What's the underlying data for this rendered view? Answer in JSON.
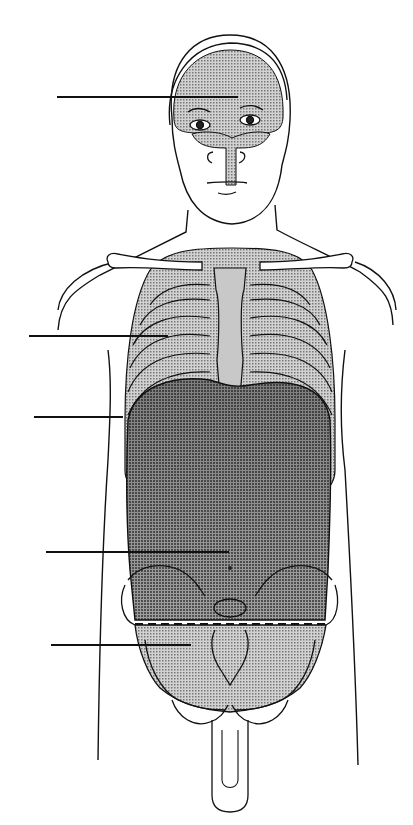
{
  "figure": {
    "width": 413,
    "height": 825,
    "background": "#ffffff",
    "stroke": "#111111",
    "cavity_fill_light": "#b8b8b8",
    "cavity_fill_dark": "#8a8a8a",
    "labels": []
  },
  "leader_lines": [
    {
      "id": "cranial-cavity-leader",
      "x1": 57,
      "y1": 97,
      "x2": 238,
      "y2": 97
    },
    {
      "id": "thoracic-cavity-leader",
      "x1": 29,
      "y1": 336,
      "x2": 168,
      "y2": 336
    },
    {
      "id": "diaphragm-leader",
      "x1": 34,
      "y1": 417,
      "x2": 123,
      "y2": 417
    },
    {
      "id": "abdominal-cavity-leader",
      "x1": 46,
      "y1": 552,
      "x2": 229,
      "y2": 552
    },
    {
      "id": "pelvic-cavity-leader",
      "x1": 51,
      "y1": 645,
      "x2": 191,
      "y2": 645
    }
  ],
  "divider": {
    "id": "abdominopelvic-divider",
    "x1": 135,
    "y1": 624,
    "x2": 326,
    "y2": 624,
    "dashed": true
  }
}
